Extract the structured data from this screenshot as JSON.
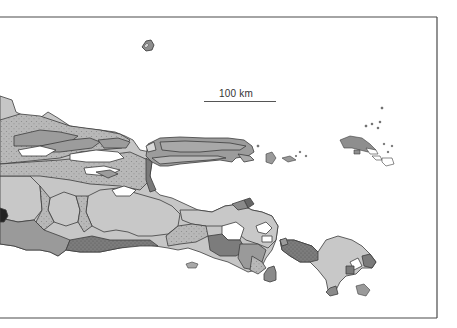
{
  "map": {
    "region": "East Java, Madura and Bali",
    "style": "grayscale geological map",
    "frame": {
      "left": 0,
      "top": 17,
      "right": 437,
      "bottom": 318
    },
    "scale_bar": {
      "label": "100 km",
      "length_px": 72
    },
    "colors": {
      "background": "#ffffff",
      "frame": "#4a4a4a",
      "outline": "#3c3c3c",
      "light_gray": "#c8c8c8",
      "dotted_gray": "#b4b4b4",
      "medium_gray": "#9a9a9a",
      "dark_gray": "#7a7a7a",
      "darkest": "#222222"
    },
    "units": [
      {
        "name": "light-gray-unit",
        "fill": "#c8c8c8"
      },
      {
        "name": "stippled-unit",
        "fill": "#b4b4b4"
      },
      {
        "name": "medium-gray-unit",
        "fill": "#9a9a9a"
      },
      {
        "name": "dark-gray-unit",
        "fill": "#7a7a7a"
      },
      {
        "name": "white-unit",
        "fill": "#ffffff"
      }
    ],
    "features": [
      "Java (east)",
      "Madura",
      "Kangean islands",
      "Bali",
      "Nusa Penida",
      "Bawean"
    ]
  }
}
